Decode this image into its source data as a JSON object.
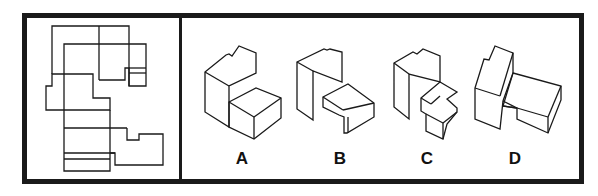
{
  "puzzle": {
    "type": "paper-folding / net-to-solid",
    "stroke_color": "#1a1a1a",
    "options": [
      {
        "id": "A",
        "label": "A"
      },
      {
        "id": "B",
        "label": "B"
      },
      {
        "id": "C",
        "label": "C"
      },
      {
        "id": "D",
        "label": "D"
      }
    ]
  }
}
